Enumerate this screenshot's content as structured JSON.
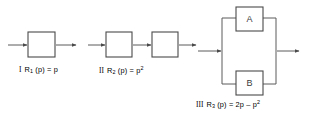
{
  "figure": {
    "background_color": "#ffffff",
    "line_color": "#4a4a4a",
    "width": 310,
    "height": 114
  },
  "diagrams": [
    {
      "id": "diagram-1",
      "numeral": "I",
      "caption_prefix": "I",
      "caption_fn": "R",
      "caption_sub": "1",
      "caption_body": " (p) = p",
      "caption_sup": "",
      "caption_full": "I  R1 (p) = p",
      "topology": "single",
      "blocks": [
        {
          "label": "",
          "name": "block-1"
        }
      ]
    },
    {
      "id": "diagram-2",
      "numeral": "II",
      "caption_prefix": "II",
      "caption_fn": "R",
      "caption_sub": "2",
      "caption_body": " (p) = p",
      "caption_sup": "2",
      "caption_full": "II  R2 (p) = p2",
      "topology": "series",
      "blocks": [
        {
          "label": "",
          "name": "block-2a"
        },
        {
          "label": "",
          "name": "block-2b"
        }
      ]
    },
    {
      "id": "diagram-3",
      "numeral": "III",
      "caption_prefix": "III",
      "caption_fn": "R",
      "caption_sub": "3",
      "caption_body": " (p) = 2p – p",
      "caption_sup": "2",
      "caption_full": "III  R3 (p) = 2p - p2",
      "topology": "parallel",
      "blocks": [
        {
          "label": "A",
          "name": "block-a"
        },
        {
          "label": "B",
          "name": "block-b"
        }
      ]
    }
  ]
}
